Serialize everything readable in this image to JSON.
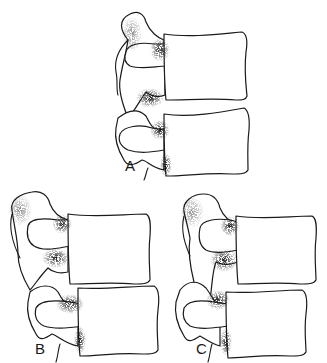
{
  "figure": {
    "panels": [
      {
        "id": "A",
        "label": "A"
      },
      {
        "id": "B",
        "label": "B"
      },
      {
        "id": "C",
        "label": "C"
      }
    ],
    "colors": {
      "ink": "#1a1a1a",
      "background": "#ffffff",
      "stipple": "#333333"
    }
  }
}
